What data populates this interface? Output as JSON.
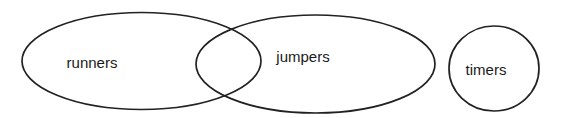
{
  "diagram": {
    "type": "venn",
    "colors": {
      "background": "#ffffff",
      "stroke": "#222222",
      "text": "#1a1a1a"
    },
    "sets": [
      {
        "id": "runners",
        "label": "runners",
        "shape": "ellipse",
        "cx": 141.5,
        "cy": 61,
        "rx": 119.5,
        "ry": 48.5,
        "label_x": 92,
        "label_y": 64
      },
      {
        "id": "jumpers",
        "label": "jumpers",
        "shape": "ellipse",
        "cx": 315.5,
        "cy": 64,
        "rx": 119.5,
        "ry": 49,
        "label_x": 303,
        "label_y": 58
      },
      {
        "id": "timers",
        "label": "timers",
        "shape": "circle",
        "cx": 494,
        "cy": 68.5,
        "rx": 45,
        "ry": 42.5,
        "label_x": 486,
        "label_y": 71
      }
    ],
    "relationships": [
      {
        "sets": [
          "runners",
          "jumpers"
        ],
        "relation": "overlap"
      },
      {
        "sets": [
          "timers"
        ],
        "relation": "disjoint"
      }
    ]
  }
}
